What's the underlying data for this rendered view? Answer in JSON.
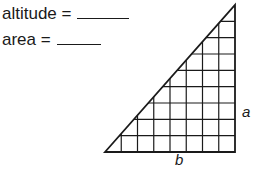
{
  "equations": [
    {
      "label": "altitude =",
      "answer": ""
    },
    {
      "label": "area =",
      "answer": ""
    }
  ],
  "figure": {
    "shape": "right triangle on grid",
    "grid_columns": 8,
    "grid_rows": 9,
    "side_labels": {
      "vertical": "a",
      "horizontal": "b"
    },
    "colors": {
      "stroke": "#1a1a1a",
      "background": "#ffffff"
    }
  }
}
